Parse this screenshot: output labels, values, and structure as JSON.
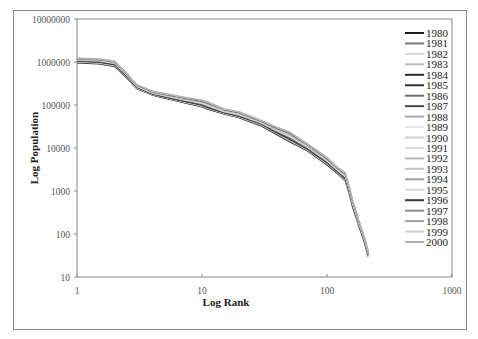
{
  "chart_data": {
    "type": "line",
    "title": "",
    "xlabel": "Log Rank",
    "ylabel": "Log Population",
    "xscale": "log",
    "yscale": "log",
    "xlim": [
      1,
      1000
    ],
    "ylim": [
      10,
      10000000
    ],
    "x_ticks": [
      "1",
      "10",
      "100",
      "1000"
    ],
    "y_ticks": [
      "10",
      "100",
      "1000",
      "10000",
      "100000",
      "1000000",
      "10000000"
    ],
    "grid": false,
    "legend_position": "right",
    "x": [
      1,
      1.5,
      2,
      2.5,
      3,
      4,
      5,
      7,
      10,
      11,
      15,
      20,
      30,
      40,
      50,
      70,
      100,
      120,
      140,
      150,
      160,
      180,
      200,
      213
    ],
    "series": [
      {
        "name": "1980",
        "color": "#1e1e1e",
        "values": [
          950000,
          900000,
          780000,
          420000,
          240000,
          170000,
          145000,
          115000,
          90000,
          80000,
          62000,
          50000,
          32000,
          20000,
          14000,
          8500,
          4000,
          2600,
          1700,
          900,
          420,
          150,
          60,
          30
        ]
      },
      {
        "name": "1981",
        "color": "#7a7a7a",
        "values": [
          980000,
          930000,
          800000,
          430000,
          245000,
          172000,
          148000,
          118000,
          92000,
          82000,
          63000,
          51000,
          33000,
          21000,
          14500,
          8800,
          4200,
          2700,
          1750,
          950,
          440,
          155,
          62,
          31
        ]
      },
      {
        "name": "1982",
        "color": "#d6d6d6",
        "values": [
          1000000,
          950000,
          820000,
          440000,
          250000,
          175000,
          150000,
          120000,
          95000,
          84000,
          64000,
          52000,
          34000,
          21500,
          15000,
          9000,
          4300,
          2800,
          1800,
          980,
          450,
          160,
          64,
          32
        ]
      },
      {
        "name": "1983",
        "color": "#bdbdbd",
        "values": [
          1020000,
          970000,
          840000,
          450000,
          255000,
          178000,
          152000,
          122000,
          97000,
          86000,
          65000,
          53000,
          35000,
          22000,
          15500,
          9200,
          4400,
          2850,
          1850,
          1000,
          460,
          165,
          66,
          33
        ]
      },
      {
        "name": "1984",
        "color": "#2a2a2a",
        "values": [
          1040000,
          990000,
          860000,
          460000,
          258000,
          180000,
          154000,
          124000,
          99000,
          88000,
          66000,
          54000,
          35500,
          22500,
          16000,
          9400,
          4500,
          2900,
          1900,
          1020,
          470,
          168,
          67,
          33
        ]
      },
      {
        "name": "1985",
        "color": "#333333",
        "values": [
          1060000,
          1010000,
          880000,
          470000,
          262000,
          182000,
          156000,
          126000,
          101000,
          90000,
          67000,
          55000,
          36000,
          23000,
          16500,
          9600,
          4600,
          2950,
          1950,
          1050,
          480,
          170,
          68,
          34
        ]
      },
      {
        "name": "1986",
        "color": "#6e6e6e",
        "values": [
          1080000,
          1030000,
          900000,
          480000,
          265000,
          184000,
          158000,
          128000,
          103000,
          92000,
          68000,
          56000,
          36500,
          23500,
          17000,
          9800,
          4700,
          3000,
          2000,
          1080,
          490,
          172,
          69,
          34
        ]
      },
      {
        "name": "1987",
        "color": "#4a4a4a",
        "values": [
          1100000,
          1050000,
          920000,
          490000,
          268000,
          186000,
          160000,
          130000,
          105000,
          94000,
          69000,
          57000,
          37000,
          24000,
          17500,
          10000,
          4800,
          3050,
          2050,
          1100,
          500,
          175,
          70,
          35
        ]
      },
      {
        "name": "1988",
        "color": "#a8a8a8",
        "values": [
          1110000,
          1060000,
          930000,
          495000,
          270000,
          188000,
          162000,
          132000,
          107000,
          96000,
          70000,
          58000,
          37500,
          24500,
          18000,
          10200,
          4900,
          3100,
          2100,
          1120,
          510,
          178,
          71,
          35
        ]
      },
      {
        "name": "1989",
        "color": "#e4e4e4",
        "values": [
          1120000,
          1070000,
          940000,
          500000,
          272000,
          190000,
          164000,
          134000,
          109000,
          98000,
          71000,
          59000,
          38000,
          25000,
          18500,
          10400,
          5000,
          3150,
          2150,
          1140,
          520,
          180,
          72,
          36
        ]
      },
      {
        "name": "1990",
        "color": "#cfcfcf",
        "values": [
          1130000,
          1080000,
          950000,
          505000,
          275000,
          192000,
          166000,
          136000,
          111000,
          100000,
          72000,
          60000,
          38500,
          25500,
          19000,
          10600,
          5100,
          3200,
          2200,
          1160,
          530,
          182,
          73,
          36
        ]
      },
      {
        "name": "1991",
        "color": "#dcdcdc",
        "values": [
          1140000,
          1090000,
          960000,
          510000,
          278000,
          194000,
          168000,
          138000,
          113000,
          102000,
          73000,
          61000,
          39000,
          26000,
          19500,
          10800,
          5200,
          3250,
          2250,
          1180,
          540,
          185,
          74,
          37
        ]
      },
      {
        "name": "1992",
        "color": "#b5b5b5",
        "values": [
          1150000,
          1100000,
          970000,
          515000,
          280000,
          196000,
          170000,
          140000,
          115000,
          104000,
          74000,
          62000,
          39500,
          26500,
          20000,
          11000,
          5300,
          3300,
          2300,
          1200,
          550,
          188,
          75,
          37
        ]
      },
      {
        "name": "1993",
        "color": "#c4c4c4",
        "values": [
          1160000,
          1110000,
          980000,
          520000,
          282000,
          198000,
          172000,
          142000,
          117000,
          106000,
          75000,
          63000,
          40000,
          27000,
          20500,
          11200,
          5400,
          3350,
          2350,
          1220,
          560,
          190,
          76,
          38
        ]
      },
      {
        "name": "1994",
        "color": "#9c9c9c",
        "values": [
          1170000,
          1120000,
          990000,
          525000,
          285000,
          200000,
          174000,
          144000,
          119000,
          108000,
          76000,
          64000,
          40500,
          27500,
          21000,
          11400,
          5500,
          3400,
          2400,
          1240,
          570,
          192,
          77,
          38
        ]
      },
      {
        "name": "1995",
        "color": "#d9d9d9",
        "values": [
          1180000,
          1130000,
          1000000,
          530000,
          288000,
          202000,
          176000,
          146000,
          121000,
          110000,
          77000,
          65000,
          41000,
          28000,
          21500,
          11600,
          5600,
          3450,
          2450,
          1260,
          580,
          195,
          78,
          39
        ]
      },
      {
        "name": "1996",
        "color": "#3a3a3a",
        "values": [
          1190000,
          1140000,
          1010000,
          535000,
          290000,
          204000,
          178000,
          148000,
          123000,
          112000,
          78000,
          66000,
          41500,
          28500,
          22000,
          11800,
          5700,
          3500,
          2500,
          1280,
          590,
          198,
          79,
          39
        ]
      },
      {
        "name": "1997",
        "color": "#8a8a8a",
        "values": [
          1200000,
          1150000,
          1020000,
          540000,
          292000,
          206000,
          180000,
          150000,
          125000,
          114000,
          79000,
          67000,
          42000,
          29000,
          22500,
          12000,
          5800,
          3550,
          2550,
          1300,
          600,
          200,
          80,
          40
        ]
      },
      {
        "name": "1998",
        "color": "#a3a3a3",
        "values": [
          1210000,
          1160000,
          1030000,
          545000,
          295000,
          208000,
          182000,
          152000,
          127000,
          116000,
          80000,
          68000,
          42500,
          29500,
          23000,
          12200,
          5900,
          3600,
          2600,
          1320,
          610,
          202,
          81,
          40
        ]
      },
      {
        "name": "1999",
        "color": "#d0d0d0",
        "values": [
          1220000,
          1170000,
          1040000,
          550000,
          298000,
          210000,
          184000,
          154000,
          129000,
          118000,
          81000,
          69000,
          43000,
          30000,
          23500,
          12400,
          6000,
          3650,
          2650,
          1340,
          620,
          205,
          82,
          41
        ]
      },
      {
        "name": "2000",
        "color": "#b0b0b0",
        "values": [
          1230000,
          1180000,
          1050000,
          555000,
          300000,
          212000,
          186000,
          156000,
          131000,
          120000,
          82000,
          70000,
          43500,
          30500,
          24000,
          12600,
          6100,
          3700,
          2700,
          1360,
          630,
          208,
          83,
          42
        ]
      }
    ]
  }
}
